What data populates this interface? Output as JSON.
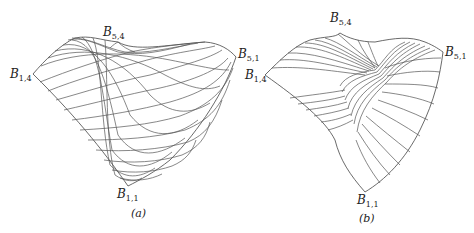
{
  "figures": [
    {
      "id": "a",
      "caption": "(a)",
      "labels": {
        "top": {
          "base": "B",
          "sub": "5,4"
        },
        "left": {
          "base": "B",
          "sub": "1,4"
        },
        "right": {
          "base": "B",
          "sub": "5,1"
        },
        "bottom": {
          "base": "B",
          "sub": "1,1"
        }
      }
    },
    {
      "id": "b",
      "caption": "(b)",
      "labels": {
        "top": {
          "base": "B",
          "sub": "5,4"
        },
        "left": {
          "base": "B",
          "sub": "1,4"
        },
        "right": {
          "base": "B",
          "sub": "5,1"
        },
        "bottom": {
          "base": "B",
          "sub": "1,1"
        }
      }
    }
  ],
  "colors": {
    "line": "#555555",
    "text": "#222222",
    "background": "#ffffff"
  }
}
